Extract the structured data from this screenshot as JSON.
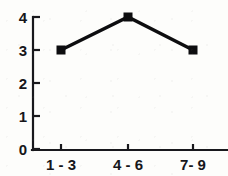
{
  "chart_data": {
    "type": "line",
    "title": "",
    "subtitle": "",
    "xlabel": "",
    "ylabel": "",
    "categories": [
      "1 - 3",
      "4 - 6",
      "7- 9"
    ],
    "values": [
      3,
      4,
      3
    ],
    "series": [
      {
        "name": "",
        "values": [
          3,
          4,
          3
        ]
      }
    ],
    "ylim": [
      0,
      4
    ],
    "y_ticks": [
      0,
      1,
      2,
      3,
      4
    ],
    "y_tick_labels": [
      "0",
      "1",
      "2",
      "3",
      "4"
    ],
    "x_tick_labels": [
      "1 - 3",
      "4 - 6",
      "7- 9"
    ],
    "grid": false,
    "legend": "none",
    "marker": "square",
    "line_color": "#0d0d0f",
    "marker_color": "#0d0d0f",
    "axis_color": "#18181c",
    "background_color": "#fdfdfb",
    "annotations": []
  },
  "axes": {
    "y_labels": [
      {
        "value": "4"
      },
      {
        "value": "3"
      },
      {
        "value": "2"
      },
      {
        "value": "1"
      },
      {
        "value": "0"
      }
    ],
    "x_labels": [
      {
        "value": "1 - 3"
      },
      {
        "value": "4 - 6"
      },
      {
        "value": "7- 9"
      }
    ]
  }
}
